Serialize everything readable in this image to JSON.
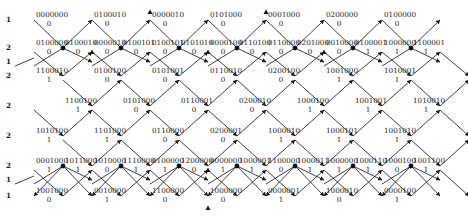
{
  "figure": {
    "type": "lattice-state-diagram",
    "left_multiplicities": [
      {
        "label": "1",
        "y": 20
      },
      {
        "label": "2",
        "y": 48
      },
      {
        "label": "1",
        "y": 62
      },
      {
        "label": "2",
        "y": 76
      },
      {
        "label": "2",
        "y": 106
      },
      {
        "label": "2",
        "y": 136
      },
      {
        "label": "2",
        "y": 166
      },
      {
        "label": "1",
        "y": 180
      },
      {
        "label": "1",
        "y": 196
      }
    ],
    "rows": [
      {
        "name": "row-1",
        "y": 20,
        "nodes": [
          {
            "code": "0000000",
            "value": "0",
            "x": 34
          },
          {
            "code": "0100010",
            "value": "0",
            "x": 92
          },
          {
            "code": "0000010",
            "value": "0",
            "x": 150
          },
          {
            "code": "0101000",
            "value": "0",
            "x": 208
          },
          {
            "code": "0001000",
            "value": "0",
            "x": 266
          },
          {
            "code": "0200000",
            "value": "0",
            "x": 324
          },
          {
            "code": "0100000",
            "value": "0",
            "x": 382
          }
        ]
      },
      {
        "name": "row-2",
        "y": 48,
        "nodes": [
          {
            "code": "0100000",
            "value": "0",
            "x": 34
          },
          {
            "code": "0100010",
            "value": "0",
            "x": 63
          },
          {
            "code": "0000010",
            "value": "0",
            "x": 92
          },
          {
            "code": "0100101",
            "value": "0",
            "x": 121
          },
          {
            "code": "0100101",
            "value": "0",
            "x": 150
          },
          {
            "code": "0101010",
            "value": "0",
            "x": 179
          },
          {
            "code": "0000100",
            "value": "0",
            "x": 208
          },
          {
            "code": "0110100",
            "value": "0",
            "x": 237
          },
          {
            "code": "0110000",
            "value": "0",
            "x": 266
          },
          {
            "code": "0201000",
            "value": "0",
            "x": 295
          },
          {
            "code": "0010000",
            "value": "0",
            "x": 324
          },
          {
            "code": "0100001",
            "value": "1",
            "x": 353
          },
          {
            "code": "1000000",
            "value": "1",
            "x": 382
          },
          {
            "code": "1100001",
            "value": "1",
            "x": 411
          }
        ]
      },
      {
        "name": "row-3",
        "y": 76,
        "nodes": [
          {
            "code": "1100010",
            "value": "1",
            "x": 34
          },
          {
            "code": "0100100",
            "value": "0",
            "x": 92
          },
          {
            "code": "0101001",
            "value": "0",
            "x": 150
          },
          {
            "code": "0110010",
            "value": "0",
            "x": 208
          },
          {
            "code": "0200100",
            "value": "0",
            "x": 266
          },
          {
            "code": "1001000",
            "value": "1",
            "x": 324
          },
          {
            "code": "1010001",
            "value": "1",
            "x": 382
          }
        ]
      },
      {
        "name": "row-4",
        "y": 106,
        "nodes": [
          {
            "code": "1100100",
            "value": "1",
            "x": 63
          },
          {
            "code": "0101000",
            "value": "0",
            "x": 121
          },
          {
            "code": "0110001",
            "value": "0",
            "x": 179
          },
          {
            "code": "0200010",
            "value": "0",
            "x": 237
          },
          {
            "code": "1000100",
            "value": "1",
            "x": 295
          },
          {
            "code": "1001001",
            "value": "1",
            "x": 353
          },
          {
            "code": "1010010",
            "value": "1",
            "x": 411
          }
        ]
      },
      {
        "name": "row-5",
        "y": 136,
        "nodes": [
          {
            "code": "1010100",
            "value": "1",
            "x": 34
          },
          {
            "code": "1101000",
            "value": "1",
            "x": 92
          },
          {
            "code": "0110000",
            "value": "0",
            "x": 150
          },
          {
            "code": "0200001",
            "value": "0",
            "x": 208
          },
          {
            "code": "1000010",
            "value": "1",
            "x": 266
          },
          {
            "code": "1000101",
            "value": "1",
            "x": 324
          },
          {
            "code": "1001010",
            "value": "1",
            "x": 382
          }
        ]
      },
      {
        "name": "row-6",
        "y": 166,
        "nodes": [
          {
            "code": "0001000",
            "value": "1",
            "x": 34
          },
          {
            "code": "1011000",
            "value": "1",
            "x": 63
          },
          {
            "code": "1010000",
            "value": "0",
            "x": 92
          },
          {
            "code": "1110000",
            "value": "1",
            "x": 121
          },
          {
            "code": "0100000",
            "value": "1",
            "x": 150
          },
          {
            "code": "1200000",
            "value": "0",
            "x": 179
          },
          {
            "code": "0000000",
            "value": "1",
            "x": 208
          },
          {
            "code": "1000001",
            "value": "1",
            "x": 237
          },
          {
            "code": "1100000",
            "value": "0",
            "x": 266
          },
          {
            "code": "1000011",
            "value": "1",
            "x": 295
          },
          {
            "code": "1000000",
            "value": "1",
            "x": 324
          },
          {
            "code": "1000110",
            "value": "1",
            "x": 353
          },
          {
            "code": "1000100",
            "value": "0",
            "x": 382
          },
          {
            "code": "1001100",
            "value": "1",
            "x": 411
          }
        ]
      },
      {
        "name": "row-7",
        "y": 196,
        "nodes": [
          {
            "code": "1001000",
            "value": "0",
            "x": 34
          },
          {
            "code": "0010000",
            "value": "1",
            "x": 92
          },
          {
            "code": "1100000",
            "value": "0",
            "x": 150
          },
          {
            "code": "1000000",
            "value": "0",
            "x": 208
          },
          {
            "code": "0000001",
            "value": "1",
            "x": 266
          },
          {
            "code": "1000010",
            "value": "0",
            "x": 324
          },
          {
            "code": "0000100",
            "value": "1",
            "x": 382
          }
        ]
      }
    ]
  }
}
